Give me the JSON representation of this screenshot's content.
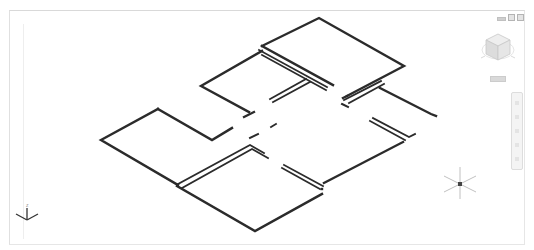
{
  "app": {
    "type": "cad-3d-viewport",
    "view": "isometric"
  },
  "viewport_controls": {
    "minimize_icon": "minimize-icon",
    "restore_icon": "restore-icon",
    "close_icon": "close-icon"
  },
  "viewcube": {
    "icon": "viewcube-icon",
    "wcs_label": "WCS"
  },
  "navigation_bar": {
    "icon": "navigation-bar"
  },
  "ucs_icon": {
    "axes": [
      "X",
      "Y",
      "Z"
    ]
  },
  "colors": {
    "background": "#ffffff",
    "wall_lines": "#2b2b2b",
    "ui_gray": "#cccccc"
  }
}
